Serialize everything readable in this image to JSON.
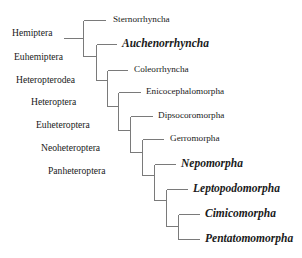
{
  "diagram": {
    "type": "phylogenetic-tree",
    "line_color": "#7a7a7a",
    "text_color": "#1a1a1a",
    "rank_labels": [
      {
        "id": "hemiptera",
        "label": "Hemiptera",
        "x": 12,
        "y": 33
      },
      {
        "id": "euhemiptera",
        "label": "Euhemiptera",
        "x": 14,
        "y": 57
      },
      {
        "id": "heteropterodea",
        "label": "Heteropterodea",
        "x": 16,
        "y": 80
      },
      {
        "id": "heteroptera",
        "label": "Heteroptera",
        "x": 31,
        "y": 102
      },
      {
        "id": "euheteroptera",
        "label": "Euheteroptera",
        "x": 36,
        "y": 125
      },
      {
        "id": "neoheteroptera",
        "label": "Neoheteroptera",
        "x": 41,
        "y": 148
      },
      {
        "id": "panheteroptera",
        "label": "Panheteroptera",
        "x": 48,
        "y": 171
      }
    ],
    "taxa": [
      {
        "id": "sternorrhyncha",
        "label": "Sternorrhyncha",
        "emphasized": false,
        "x": 113,
        "y": 20
      },
      {
        "id": "auchenorrhyncha",
        "label": "Auchenorrhyncha",
        "emphasized": true,
        "x": 122,
        "y": 44
      },
      {
        "id": "coleorrhyncha",
        "label": "Coleorrhyncha",
        "emphasized": false,
        "x": 134,
        "y": 70
      },
      {
        "id": "enicocephalomorpha",
        "label": "Enicocephalomorpha",
        "emphasized": false,
        "x": 146,
        "y": 92
      },
      {
        "id": "dipsocoromorpha",
        "label": "Dipsocoromorpha",
        "emphasized": false,
        "x": 158,
        "y": 116
      },
      {
        "id": "gerromorpha",
        "label": "Gerromorpha",
        "emphasized": false,
        "x": 170,
        "y": 139
      },
      {
        "id": "nepomorpha",
        "label": "Nepomorpha",
        "emphasized": true,
        "x": 181,
        "y": 164
      },
      {
        "id": "leptopodomorpha",
        "label": "Leptopodomorpha",
        "emphasized": true,
        "x": 193,
        "y": 189
      },
      {
        "id": "cimicomorpha",
        "label": "Cimicomorpha",
        "emphasized": true,
        "x": 205,
        "y": 214
      },
      {
        "id": "pentatomomorpha",
        "label": "Pentatomomorpha",
        "emphasized": true,
        "x": 205,
        "y": 239
      }
    ],
    "branches": [
      {
        "x1": 63,
        "y1": 38,
        "x2": 83,
        "y2": 38
      },
      {
        "x1": 83,
        "y1": 20,
        "x2": 83,
        "y2": 56
      },
      {
        "x1": 83,
        "y1": 20,
        "x2": 105,
        "y2": 20
      },
      {
        "x1": 83,
        "y1": 56,
        "x2": 96,
        "y2": 56
      },
      {
        "x1": 96,
        "y1": 44,
        "x2": 96,
        "y2": 80
      },
      {
        "x1": 96,
        "y1": 44,
        "x2": 116,
        "y2": 44
      },
      {
        "x1": 96,
        "y1": 80,
        "x2": 107,
        "y2": 80
      },
      {
        "x1": 107,
        "y1": 70,
        "x2": 107,
        "y2": 106
      },
      {
        "x1": 107,
        "y1": 70,
        "x2": 127,
        "y2": 70
      },
      {
        "x1": 107,
        "y1": 106,
        "x2": 118,
        "y2": 106
      },
      {
        "x1": 118,
        "y1": 92,
        "x2": 118,
        "y2": 130
      },
      {
        "x1": 118,
        "y1": 92,
        "x2": 140,
        "y2": 92
      },
      {
        "x1": 118,
        "y1": 130,
        "x2": 130,
        "y2": 130
      },
      {
        "x1": 130,
        "y1": 116,
        "x2": 130,
        "y2": 152
      },
      {
        "x1": 130,
        "y1": 116,
        "x2": 152,
        "y2": 116
      },
      {
        "x1": 130,
        "y1": 152,
        "x2": 142,
        "y2": 152
      },
      {
        "x1": 142,
        "y1": 139,
        "x2": 142,
        "y2": 175
      },
      {
        "x1": 142,
        "y1": 139,
        "x2": 163,
        "y2": 139
      },
      {
        "x1": 142,
        "y1": 175,
        "x2": 154,
        "y2": 175
      },
      {
        "x1": 154,
        "y1": 164,
        "x2": 154,
        "y2": 200
      },
      {
        "x1": 154,
        "y1": 164,
        "x2": 175,
        "y2": 164
      },
      {
        "x1": 154,
        "y1": 200,
        "x2": 166,
        "y2": 200
      },
      {
        "x1": 166,
        "y1": 189,
        "x2": 166,
        "y2": 226
      },
      {
        "x1": 166,
        "y1": 189,
        "x2": 187,
        "y2": 189
      },
      {
        "x1": 166,
        "y1": 226,
        "x2": 178,
        "y2": 226
      },
      {
        "x1": 178,
        "y1": 214,
        "x2": 178,
        "y2": 239
      },
      {
        "x1": 178,
        "y1": 214,
        "x2": 199,
        "y2": 214
      },
      {
        "x1": 178,
        "y1": 239,
        "x2": 199,
        "y2": 239
      }
    ]
  }
}
